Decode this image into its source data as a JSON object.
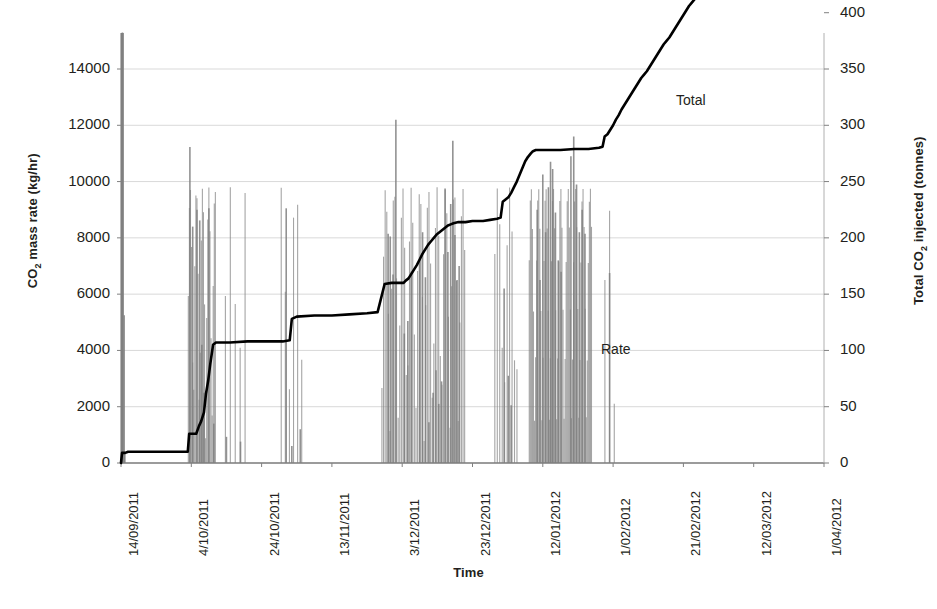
{
  "chart_data": {
    "type": "line",
    "title": "",
    "xlabel": "Time",
    "ylabel": "CO2 mass rate (kg/hr)",
    "ylabel_right": "Total CO2 injected (tonnes)",
    "grid": true,
    "legend_position": "inline-annotations",
    "annotations": [
      {
        "text": "Total",
        "x_px": 676,
        "y_px": 92
      },
      {
        "text": "Rate",
        "x_px": 601,
        "y_px": 341
      }
    ],
    "x_axis": {
      "start": "14/09/2011",
      "end": "1/04/2012",
      "tick_labels": [
        "14/09/2011",
        "4/10/2011",
        "24/10/2011",
        "13/11/2011",
        "3/12/2011",
        "23/12/2011",
        "12/01/2012",
        "1/02/2012",
        "21/02/2012",
        "12/03/2012",
        "1/04/2012"
      ],
      "tick_day_offsets": [
        0,
        20,
        40,
        60,
        80,
        100,
        120,
        140,
        160,
        180,
        200
      ]
    },
    "y_axis_left": {
      "label": "CO2 mass rate (kg/hr)",
      "min": 0,
      "max": 14000,
      "step": 2000,
      "tick_labels": [
        "0",
        "2000",
        "4000",
        "6000",
        "8000",
        "10000",
        "12000",
        "14000"
      ]
    },
    "y_axis_right": {
      "label": "Total CO2 injected (tonnes)",
      "min": 0,
      "max": 500,
      "step": 50,
      "tick_labels": [
        "0",
        "50",
        "100",
        "150",
        "200",
        "250",
        "300",
        "350",
        "400",
        "450",
        "500"
      ]
    },
    "series": [
      {
        "name": "Rate",
        "type": "impulse-bars",
        "axis": "left",
        "unit": "kg/hr",
        "color": "#808080",
        "points": [
          [
            0.4,
            15300
          ],
          [
            0.9,
            5250
          ],
          [
            1.1,
            330
          ],
          [
            19.6,
            11230
          ],
          [
            20.4,
            8400
          ],
          [
            21.6,
            9000
          ],
          [
            22.4,
            8620
          ],
          [
            23.0,
            4200
          ],
          [
            23.6,
            2500
          ],
          [
            25.0,
            9050
          ],
          [
            26.4,
            1400
          ],
          [
            30.0,
            930
          ],
          [
            34.0,
            760
          ],
          [
            47.0,
            9050
          ],
          [
            48.6,
            600
          ],
          [
            51.0,
            1200
          ],
          [
            76.0,
            8150
          ],
          [
            76.6,
            8050
          ],
          [
            77.4,
            6700
          ],
          [
            78.2,
            12200
          ],
          [
            80.6,
            4600
          ],
          [
            81.6,
            5050
          ],
          [
            82.6,
            6800
          ],
          [
            85.0,
            7250
          ],
          [
            85.8,
            8200
          ],
          [
            86.6,
            6600
          ],
          [
            87.6,
            1450
          ],
          [
            88.8,
            2500
          ],
          [
            89.6,
            3300
          ],
          [
            90.4,
            2100
          ],
          [
            91.2,
            2900
          ],
          [
            92.2,
            9750
          ],
          [
            93.0,
            7500
          ],
          [
            93.8,
            9200
          ],
          [
            94.4,
            11450
          ],
          [
            95.0,
            8100
          ],
          [
            95.6,
            6500
          ],
          [
            96.2,
            7000
          ],
          [
            109.0,
            6200
          ],
          [
            110.2,
            3100
          ],
          [
            111.0,
            2050
          ],
          [
            118.4,
            9000
          ],
          [
            119.2,
            6500
          ],
          [
            120.0,
            10250
          ],
          [
            120.8,
            8200
          ],
          [
            121.6,
            9800
          ],
          [
            122.2,
            10700
          ],
          [
            122.8,
            10450
          ],
          [
            123.6,
            8900
          ],
          [
            124.4,
            7200
          ],
          [
            125.2,
            6800
          ],
          [
            128.0,
            10900
          ],
          [
            128.8,
            11600
          ],
          [
            129.6,
            9900
          ],
          [
            130.4,
            8200
          ],
          [
            131.2,
            9000
          ],
          [
            132.0,
            8150
          ],
          [
            139.0,
            6750
          ]
        ]
      },
      {
        "name": "Total",
        "type": "step-line",
        "axis": "right",
        "unit": "tonnes",
        "color": "#000000",
        "points": [
          [
            0.0,
            0
          ],
          [
            0.3,
            9
          ],
          [
            1.2,
            9
          ],
          [
            2.0,
            10
          ],
          [
            5.0,
            10
          ],
          [
            9.0,
            10
          ],
          [
            13.0,
            10
          ],
          [
            17.0,
            10
          ],
          [
            19.0,
            10
          ],
          [
            19.4,
            26
          ],
          [
            21.4,
            26
          ],
          [
            22.2,
            33
          ],
          [
            22.8,
            37
          ],
          [
            23.6,
            45
          ],
          [
            24.2,
            62
          ],
          [
            24.8,
            73
          ],
          [
            25.4,
            88
          ],
          [
            26.2,
            105
          ],
          [
            27.0,
            107
          ],
          [
            31.0,
            107
          ],
          [
            36.0,
            108
          ],
          [
            41.0,
            108
          ],
          [
            46.0,
            108
          ],
          [
            48.0,
            109
          ],
          [
            48.6,
            128
          ],
          [
            50.0,
            130
          ],
          [
            55.0,
            131
          ],
          [
            60.0,
            131
          ],
          [
            65.0,
            132
          ],
          [
            70.0,
            133
          ],
          [
            73.0,
            134
          ],
          [
            75.0,
            159
          ],
          [
            77.0,
            160
          ],
          [
            79.0,
            160
          ],
          [
            80.4,
            160
          ],
          [
            81.0,
            162
          ],
          [
            81.8,
            164
          ],
          [
            82.6,
            168
          ],
          [
            83.4,
            172
          ],
          [
            84.2,
            176
          ],
          [
            85.0,
            181
          ],
          [
            85.8,
            186
          ],
          [
            86.6,
            190
          ],
          [
            87.4,
            194
          ],
          [
            88.2,
            197
          ],
          [
            89.0,
            200
          ],
          [
            89.8,
            203
          ],
          [
            90.6,
            205
          ],
          [
            91.4,
            207
          ],
          [
            92.2,
            209
          ],
          [
            93.0,
            211
          ],
          [
            93.8,
            212
          ],
          [
            94.6,
            213
          ],
          [
            96.0,
            214
          ],
          [
            98.0,
            214
          ],
          [
            100.0,
            215
          ],
          [
            103.0,
            215
          ],
          [
            105.0,
            216
          ],
          [
            107.0,
            217
          ],
          [
            108.0,
            218
          ],
          [
            108.6,
            232
          ],
          [
            109.4,
            234
          ],
          [
            110.2,
            236
          ],
          [
            111.0,
            240
          ],
          [
            111.8,
            245
          ],
          [
            112.6,
            250
          ],
          [
            113.4,
            256
          ],
          [
            114.2,
            262
          ],
          [
            115.0,
            268
          ],
          [
            115.8,
            272
          ],
          [
            116.6,
            275
          ],
          [
            117.2,
            277
          ],
          [
            118.0,
            278
          ],
          [
            121.0,
            278
          ],
          [
            125.0,
            278
          ],
          [
            129.0,
            279
          ],
          [
            133.0,
            279
          ],
          [
            136.0,
            280
          ],
          [
            137.0,
            281
          ],
          [
            137.6,
            290
          ],
          [
            138.4,
            292
          ],
          [
            139.2,
            296
          ],
          [
            140.0,
            300
          ],
          [
            140.8,
            305
          ],
          [
            141.6,
            309
          ],
          [
            142.4,
            314
          ],
          [
            143.2,
            318
          ],
          [
            144.0,
            322
          ],
          [
            144.8,
            326
          ],
          [
            145.6,
            330
          ],
          [
            146.4,
            334
          ],
          [
            147.2,
            338
          ],
          [
            148.0,
            342
          ],
          [
            148.8,
            345
          ],
          [
            149.6,
            348
          ],
          [
            150.4,
            352
          ],
          [
            151.2,
            356
          ],
          [
            152.0,
            360
          ],
          [
            152.8,
            364
          ],
          [
            153.6,
            368
          ],
          [
            154.4,
            372
          ],
          [
            155.2,
            375
          ],
          [
            156.0,
            378
          ],
          [
            156.8,
            382
          ],
          [
            157.6,
            386
          ],
          [
            158.4,
            390
          ],
          [
            159.2,
            394
          ],
          [
            160.0,
            398
          ],
          [
            160.8,
            402
          ],
          [
            161.6,
            406
          ],
          [
            162.4,
            409
          ],
          [
            163.2,
            412
          ],
          [
            164.0,
            414
          ],
          [
            164.8,
            418
          ],
          [
            165.6,
            421
          ],
          [
            166.4,
            424
          ],
          [
            167.2,
            427
          ],
          [
            168.0,
            430
          ],
          [
            168.8,
            434
          ],
          [
            169.6,
            437
          ],
          [
            170.4,
            440
          ],
          [
            171.2,
            443
          ],
          [
            172.0,
            446
          ],
          [
            172.8,
            449
          ],
          [
            173.6,
            452
          ],
          [
            174.4,
            455
          ],
          [
            175.2,
            457
          ],
          [
            176.0,
            459
          ],
          [
            177.0,
            460
          ],
          [
            180.0,
            460
          ],
          [
            185.0,
            460
          ],
          [
            190.0,
            460
          ],
          [
            195.0,
            460
          ],
          [
            200.0,
            460
          ]
        ]
      }
    ]
  },
  "axis_titles": {
    "left_prefix": "CO",
    "left_sub": "2",
    "left_suffix": " mass rate (kg/hr)",
    "right_prefix": "Total CO",
    "right_sub": "2",
    "right_suffix": " injected (tonnes)",
    "x": "Time"
  },
  "colors": {
    "rate_bars": "#808080",
    "total_line": "#000000",
    "gridline": "#d9d9d9",
    "axis": "#a6a6a6",
    "text": "#231f20"
  }
}
